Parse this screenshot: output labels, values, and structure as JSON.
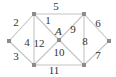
{
  "diagram": {
    "type": "graph",
    "colors": {
      "edge": "#c4c4c4",
      "node": "#8c8c8c",
      "text": "#333333",
      "background": "#ffffff"
    },
    "nodes": [
      {
        "id": "L",
        "x": 9,
        "y": 41,
        "label": ""
      },
      {
        "id": "TL",
        "x": 34,
        "y": 14,
        "label": ""
      },
      {
        "id": "TR",
        "x": 84,
        "y": 14,
        "label": ""
      },
      {
        "id": "R",
        "x": 109,
        "y": 41,
        "label": ""
      },
      {
        "id": "A",
        "x": 59,
        "y": 40,
        "label": "A"
      },
      {
        "id": "BL",
        "x": 34,
        "y": 65,
        "label": ""
      },
      {
        "id": "BR",
        "x": 84,
        "y": 65,
        "label": ""
      }
    ],
    "edges": [
      {
        "label": "1",
        "from": "TL",
        "to": "A",
        "lx": 48,
        "ly": 24
      },
      {
        "label": "2",
        "from": "L",
        "to": "TL",
        "lx": 16,
        "ly": 26
      },
      {
        "label": "3",
        "from": "L",
        "to": "BL",
        "lx": 16,
        "ly": 60
      },
      {
        "label": "4",
        "from": "TL",
        "to": "BL",
        "lx": 27,
        "ly": 46
      },
      {
        "label": "5",
        "from": "TL",
        "to": "TR",
        "lx": 56,
        "ly": 10
      },
      {
        "label": "6",
        "from": "TR",
        "to": "R",
        "lx": 98,
        "ly": 27
      },
      {
        "label": "7",
        "from": "R",
        "to": "BR",
        "lx": 98,
        "ly": 59
      },
      {
        "label": "8",
        "from": "TR",
        "to": "BR",
        "lx": 85,
        "ly": 45
      },
      {
        "label": "9",
        "from": "A",
        "to": "TR",
        "lx": 73,
        "ly": 33
      },
      {
        "label": "10",
        "from": "A",
        "to": "BR",
        "lx": 59,
        "ly": 56
      },
      {
        "label": "11",
        "from": "BL",
        "to": "BR",
        "lx": 54,
        "ly": 74
      },
      {
        "label": "12",
        "from": "A",
        "to": "BL",
        "lx": 39,
        "ly": 47
      }
    ],
    "node_label_pos": {
      "A": {
        "x": 55,
        "y": 35
      }
    }
  }
}
